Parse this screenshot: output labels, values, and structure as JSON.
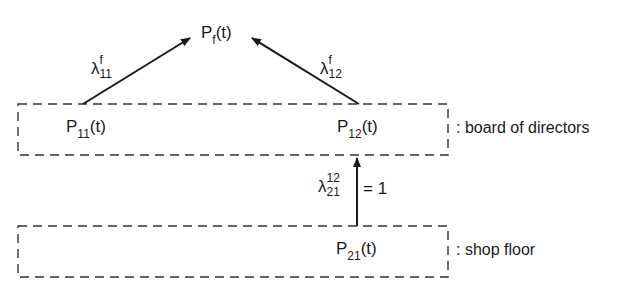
{
  "diagram": {
    "nodes": {
      "pf": {
        "base": "P",
        "sub": "f",
        "arg": "(t)"
      },
      "p11": {
        "base": "P",
        "sub": "11",
        "arg": "(t)"
      },
      "p12": {
        "base": "P",
        "sub": "12",
        "arg": "(t)"
      },
      "p21": {
        "base": "P",
        "sub": "21",
        "arg": "(t)"
      }
    },
    "edges": {
      "e11f": {
        "symbol": "λ",
        "sup": "f",
        "sub": "11",
        "from": "p11",
        "to": "pf"
      },
      "e12f": {
        "symbol": "λ",
        "sup": "f",
        "sub": "12",
        "from": "p12",
        "to": "pf"
      },
      "e2112": {
        "symbol": "λ",
        "sup": "12",
        "sub": "21",
        "value": "= 1",
        "from": "p21",
        "to": "p12"
      }
    },
    "groups": {
      "board": {
        "caption": ": board of directors"
      },
      "shop": {
        "caption": ": shop floor"
      }
    },
    "colors": {
      "ink": "#1a1a1a",
      "background": "#ffffff"
    }
  }
}
